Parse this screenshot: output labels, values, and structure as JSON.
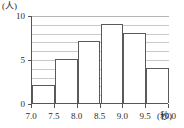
{
  "chart_data": {
    "type": "bar",
    "title": "",
    "subtitle": "",
    "xlabel": "(秒)",
    "ylabel": "(人)",
    "categories": [
      "7.0-7.5",
      "7.5-8.0",
      "8.0-8.5",
      "8.5-9.0",
      "9.0-9.5",
      "9.5-10.0"
    ],
    "bin_edges": [
      "7.0",
      "7.5",
      "8.0",
      "8.5",
      "9.0",
      "9.5",
      "10.0"
    ],
    "values": [
      2,
      5,
      7,
      9,
      8,
      4
    ],
    "xlim": [
      7.0,
      10.0
    ],
    "ylim": [
      0,
      10
    ],
    "x_tick_labels": [
      "7.0",
      "7.5",
      "8.0",
      "8.5",
      "9.0",
      "9.5",
      "10.0"
    ],
    "y_tick_labels": [
      "0",
      "5",
      "10"
    ],
    "y_gridline_values": [
      1,
      2,
      3,
      4,
      5,
      6,
      7,
      8,
      9,
      10
    ],
    "grid": true,
    "legend": false,
    "legend_position": "none",
    "bar_fill_color": "#ffffff",
    "bar_border_color": "#5a5a5a",
    "gridline_color": "#c9c9c9",
    "axis_color": "#555555",
    "text_color": "#2b2b2b"
  }
}
